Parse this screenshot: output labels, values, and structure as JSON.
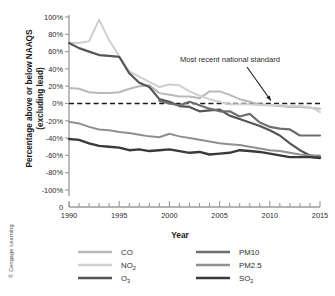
{
  "figure": {
    "credit": "© Cengage Learning"
  },
  "chart_data": {
    "type": "line",
    "title": "",
    "xlabel": "Year",
    "ylabel": "Percentage above or below NAAQS (excluding lead)",
    "ylabel_line1": "Percentage above or below NAAQS",
    "ylabel_line2": "(excluding lead)",
    "xlim": [
      1990,
      2015
    ],
    "ylim": [
      -100,
      100
    ],
    "grid": false,
    "axis_break_label": "0",
    "y_ticks": [
      "100%",
      "80%",
      "60%",
      "40%",
      "20%",
      "0%",
      "-20%",
      "-40%",
      "-60%",
      "-80%",
      "-100%"
    ],
    "y_tick_values": [
      100,
      80,
      60,
      40,
      20,
      0,
      -20,
      -40,
      -60,
      -80,
      -100
    ],
    "x_ticks": [
      1990,
      1995,
      2000,
      2005,
      2010,
      2015
    ],
    "x_tick_labels": [
      "1990",
      "1995",
      "2000",
      "2005",
      "2010",
      "2015"
    ],
    "x_minor_step": 1,
    "annotations": [
      {
        "text": "Most recent national standard",
        "points_to_year": 2010,
        "points_to_value": 0,
        "description": "arrow pointing to dashed zero reference line"
      }
    ],
    "reference_line": {
      "value": 0,
      "style": "dashed",
      "color": "#1a1a1a"
    },
    "legend_position": "below",
    "x": [
      1990,
      1991,
      1992,
      1993,
      1994,
      1995,
      1996,
      1997,
      1998,
      1999,
      2000,
      2001,
      2002,
      2003,
      2004,
      2005,
      2006,
      2007,
      2008,
      2009,
      2010,
      2011,
      2012,
      2013,
      2014,
      2015
    ],
    "series": [
      {
        "name": "CO",
        "color": "#b9b9b9",
        "width": 2.0,
        "values": [
          18,
          17,
          13,
          12,
          12,
          13,
          17,
          20,
          21,
          12,
          10,
          8,
          8,
          6,
          14,
          14,
          10,
          5,
          2,
          -1,
          -2,
          -3,
          -4,
          -4,
          -5,
          -6
        ]
      },
      {
        "name": "NO2",
        "color": "#cfcfcf",
        "width": 2.0,
        "values": [
          70,
          70,
          72,
          97,
          73,
          55,
          37,
          31,
          25,
          19,
          22,
          21,
          14,
          9,
          5,
          2,
          -1,
          -1,
          -1,
          -2,
          -2,
          -2,
          -3,
          -3,
          -4,
          -10
        ]
      },
      {
        "name": "O3",
        "color": "#555555",
        "width": 2.2,
        "values": [
          70,
          64,
          60,
          56,
          55,
          54,
          35,
          24,
          19,
          5,
          2,
          -3,
          -4,
          -9,
          -8,
          -7,
          -14,
          -18,
          -22,
          -26,
          -31,
          -37,
          -46,
          -54,
          -60,
          -62
        ]
      },
      {
        "name": "PM10",
        "color": "#6e6e6e",
        "width": 2.2,
        "values": [
          null,
          null,
          null,
          null,
          null,
          null,
          null,
          null,
          null,
          3,
          0,
          -2,
          2,
          -2,
          -6,
          -9,
          -9,
          -15,
          -12,
          -22,
          -27,
          -29,
          -30,
          -37,
          -37,
          -37
        ]
      },
      {
        "name": "PM2.5",
        "color": "#8f8f8f",
        "width": 2.0,
        "values": [
          -21,
          -23,
          -27,
          -30,
          -31,
          -33,
          -34,
          -36,
          -38,
          -39,
          -35,
          -38,
          -40,
          -42,
          -44,
          -46,
          -47,
          -48,
          -50,
          -52,
          -54,
          -55,
          -57,
          -59,
          -60,
          -60
        ]
      },
      {
        "name": "SO2",
        "color": "#3a3a3a",
        "width": 2.4,
        "values": [
          -41,
          -42,
          -46,
          -49,
          -50,
          -51,
          -54,
          -53,
          -55,
          -54,
          -53,
          -55,
          -57,
          -56,
          -59,
          -58,
          -57,
          -54,
          -55,
          -56,
          -58,
          -60,
          -62,
          -62,
          -62,
          -63
        ]
      }
    ],
    "legend": [
      {
        "label": "CO",
        "sub": "",
        "color": "#b9b9b9"
      },
      {
        "label": "NO",
        "sub": "2",
        "color": "#cfcfcf"
      },
      {
        "label": "O",
        "sub": "3",
        "color": "#555555"
      },
      {
        "label": "PM10",
        "sub": "",
        "color": "#6e6e6e"
      },
      {
        "label": "PM2.5",
        "sub": "",
        "color": "#8f8f8f"
      },
      {
        "label": "SO",
        "sub": "2",
        "color": "#3a3a3a"
      }
    ]
  }
}
